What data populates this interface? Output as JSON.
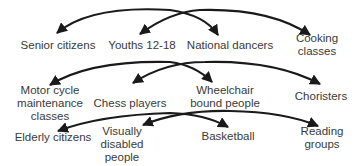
{
  "diagram": {
    "type": "pairing-arrows",
    "colors": {
      "arrow": "#1a1a1a",
      "text": "#3a3a3a",
      "background": "#ffffff"
    },
    "rows": [
      {
        "labels": [
          {
            "id": "senior",
            "text": "Senior citizens",
            "lines": [
              "Senior citizens"
            ],
            "x": 58,
            "y": 39
          },
          {
            "id": "youths",
            "text": "Youths 12-18",
            "lines": [
              "Youths 12-18"
            ],
            "x": 142,
            "y": 39
          },
          {
            "id": "dancers",
            "text": "National dancers",
            "lines": [
              "National dancers"
            ],
            "x": 230,
            "y": 39
          },
          {
            "id": "cooking",
            "text": "Cooking classes",
            "lines": [
              "Cooking",
              "classes"
            ],
            "x": 317,
            "y": 32
          }
        ],
        "arcs": [
          {
            "from": "senior",
            "to": "dancers"
          },
          {
            "from": "youths",
            "to": "cooking"
          }
        ]
      },
      {
        "labels": [
          {
            "id": "motor",
            "text": "Motor cycle maintenance classes",
            "lines": [
              "Motor cycle",
              "maintenance",
              "classes"
            ],
            "x": 50,
            "y": 84
          },
          {
            "id": "chess",
            "text": "Chess players",
            "lines": [
              "Chess players"
            ],
            "x": 130,
            "y": 97
          },
          {
            "id": "wheelchair",
            "text": "Wheelchair bound people",
            "lines": [
              "Wheelchair",
              "bound people"
            ],
            "x": 225,
            "y": 84
          },
          {
            "id": "choristers",
            "text": "Choristers",
            "lines": [
              "Choristers"
            ],
            "x": 321,
            "y": 90
          }
        ],
        "arcs": [
          {
            "from": "motor",
            "to": "wheelchair"
          },
          {
            "from": "chess",
            "to": "choristers"
          }
        ]
      },
      {
        "labels": [
          {
            "id": "elderly",
            "text": "Elderly citizens",
            "lines": [
              "Elderly citizens"
            ],
            "x": 53,
            "y": 131
          },
          {
            "id": "visually",
            "text": "Visually disabled people",
            "lines": [
              "Visually",
              "disabled",
              "people"
            ],
            "x": 122,
            "y": 125
          },
          {
            "id": "basketball",
            "text": "Basketball",
            "lines": [
              "Basketball"
            ],
            "x": 228,
            "y": 130
          },
          {
            "id": "reading",
            "text": "Reading groups",
            "lines": [
              "Reading",
              "groups"
            ],
            "x": 322,
            "y": 125
          }
        ],
        "arcs": [
          {
            "from": "elderly",
            "to": "basketball"
          },
          {
            "from": "visually",
            "to": "reading"
          }
        ]
      }
    ]
  }
}
